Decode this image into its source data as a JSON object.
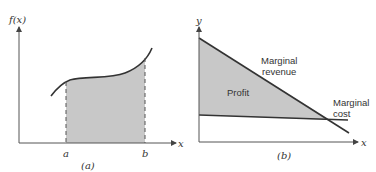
{
  "panels": [
    {
      "id": "a",
      "caption": "(a)",
      "y_axis_label": "f(x)",
      "x_axis_label": "x",
      "bound_a": "a",
      "bound_b": "b",
      "description": "Shaded area under curve f(x) between x=a and x=b"
    },
    {
      "id": "b",
      "caption": "(b)",
      "y_axis_label": "y",
      "x_axis_label": "x",
      "region_label": "Profit",
      "revenue_label_line1": "Marginal",
      "revenue_label_line2": "revenue",
      "cost_label_line1": "Marginal",
      "cost_label_line2": "cost",
      "description": "Profit region between marginal revenue and marginal cost lines"
    }
  ],
  "colors": {
    "shade": "#c8c8c8",
    "line": "#333333",
    "axis": "#555555"
  }
}
